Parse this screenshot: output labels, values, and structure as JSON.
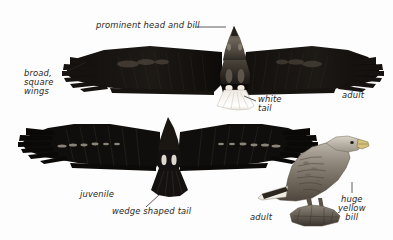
{
  "plate": {
    "title": "White-tailed Eagle identification plate",
    "background_color": "#fdfdfd",
    "ink_color": "#1a1614",
    "text_color": "#2a2622",
    "width": 393,
    "height": 240
  },
  "annotations": {
    "prominent_head_and_bill": "prominent head and bill",
    "broad_square_wings": "broad,\nsquare\nwings",
    "white_tail": "white\ntail",
    "adult_flight": "adult",
    "juvenile_flight": "juvenile",
    "wedge_shaped_tail": "wedge shaped tail",
    "adult_perched": "adult",
    "huge_yellow_bill": "huge\nyellow\nbill"
  },
  "figures": [
    {
      "id": "adult-flight",
      "name": "adult-eagle-flight-underside",
      "age": "adult",
      "view": "underside in flight",
      "features": [
        "prominent head and bill",
        "broad, square wings",
        "white tail"
      ],
      "plumage": "dark brown-black body and wings, pale grey head, white wedge tail"
    },
    {
      "id": "juvenile-flight",
      "name": "juvenile-eagle-flight-underside",
      "age": "juvenile",
      "view": "underside in flight",
      "features": [
        "wedge shaped tail"
      ],
      "plumage": "uniformly dark with pale mottling on underwing coverts, dark tail"
    },
    {
      "id": "adult-perched",
      "name": "adult-eagle-perched",
      "age": "adult",
      "view": "perched, facing right",
      "features": [
        "huge yellow bill"
      ],
      "plumage": "pale greyish head and breast, brown scaled mantle and wings, perched on rock"
    }
  ]
}
